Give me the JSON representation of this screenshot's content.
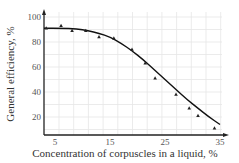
{
  "chart_data": {
    "type": "scatter",
    "title": "",
    "xlabel": "Concentration of corpuscles in a liquid, %",
    "ylabel": "General efficiency, %",
    "xlim": [
      3,
      37
    ],
    "ylim": [
      0,
      102
    ],
    "x_ticks": [
      5,
      15,
      25,
      35
    ],
    "y_ticks": [
      20,
      40,
      60,
      80,
      100
    ],
    "grid": true,
    "legend": null,
    "series": [
      {
        "name": "measured",
        "marker": "triangle",
        "x": [
          3.4,
          6.1,
          8.1,
          10.6,
          13.0,
          15.7,
          19.0,
          21.4,
          23.2,
          27.0,
          29.4,
          31.0,
          34.0
        ],
        "y": [
          91,
          93,
          89,
          89,
          84,
          83,
          74,
          63,
          51,
          38,
          27,
          21,
          11
        ]
      },
      {
        "name": "fitted curve",
        "type": "line",
        "x": [
          3,
          6,
          9,
          11,
          13,
          15,
          17,
          19,
          21,
          23,
          25,
          27,
          29,
          31,
          33,
          35,
          37
        ],
        "y": [
          91,
          91,
          90.5,
          89,
          87,
          84,
          79,
          73,
          66,
          58,
          50,
          42,
          34,
          27,
          20,
          14,
          7
        ]
      }
    ]
  }
}
